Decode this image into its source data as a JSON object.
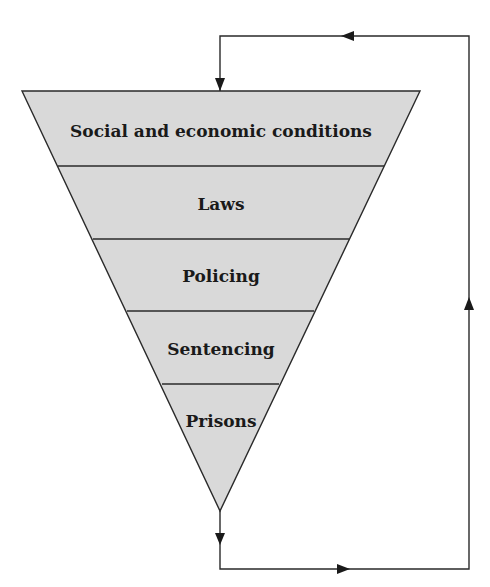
{
  "diagram": {
    "type": "inverted-funnel-with-feedback-loop",
    "fill_color": "#d9d9d9",
    "line_color": "#2a2a2a",
    "stages": [
      {
        "label": "Social and economic conditions"
      },
      {
        "label": "Laws"
      },
      {
        "label": "Policing"
      },
      {
        "label": "Sentencing"
      },
      {
        "label": "Prisons"
      }
    ],
    "feedback_loop": {
      "description": "Output of the funnel loops back to the top (Social and economic conditions)",
      "arrows": [
        {
          "segment": "funnel-tip-down",
          "direction": "down"
        },
        {
          "segment": "bottom",
          "direction": "right"
        },
        {
          "segment": "right-side",
          "direction": "up"
        },
        {
          "segment": "top",
          "direction": "left"
        },
        {
          "segment": "into-funnel-top",
          "direction": "down"
        }
      ]
    }
  }
}
